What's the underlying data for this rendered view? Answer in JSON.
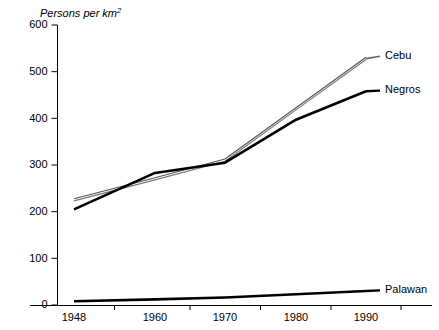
{
  "chart_data": {
    "type": "line",
    "title": "",
    "ylabel": "Persons per km",
    "ylabel_superscript": "2",
    "xlabel": "",
    "ylim": [
      0,
      600
    ],
    "yticks": [
      0,
      100,
      200,
      300,
      400,
      500,
      600
    ],
    "ytick_labels": [
      "0",
      "100",
      "200",
      "300",
      "400",
      "500",
      "600"
    ],
    "x": [
      1948,
      1960,
      1970,
      1980,
      1990
    ],
    "xtick_labels": [
      "1948",
      "1960",
      "1970",
      "1980",
      "1990"
    ],
    "grid": false,
    "legend_position": "right-of-line-ends",
    "series": [
      {
        "name": "Cebu",
        "label": "Cebu",
        "style": "thin-double-gray",
        "color": "#555555",
        "values": [
          225,
          270,
          310,
          420,
          528
        ]
      },
      {
        "name": "Negros",
        "label": "Negros",
        "style": "thick-black",
        "color": "#000000",
        "values": [
          205,
          283,
          305,
          397,
          458
        ]
      },
      {
        "name": "Palawan",
        "label": "Palawan",
        "style": "thick-black",
        "color": "#000000",
        "values": [
          8,
          12,
          16,
          23,
          30
        ]
      }
    ]
  },
  "axis": {
    "y_title_text": "Persons per km",
    "y_title_sup": "2"
  }
}
